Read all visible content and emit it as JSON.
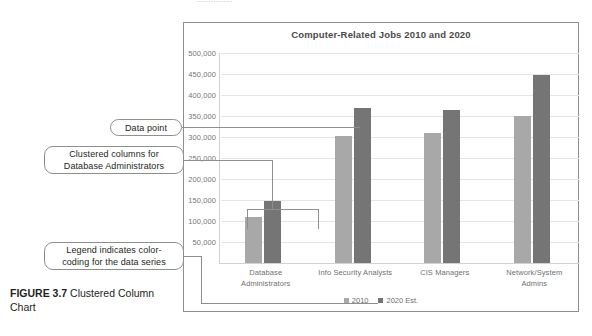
{
  "page": {
    "top_bleed_text": "..............."
  },
  "figure": {
    "number_label": "FIGURE 3.7",
    "caption_text": " Clustered Column Chart"
  },
  "chart": {
    "title": "Computer-Related Jobs 2010 and 2020",
    "legend_position": "bottom",
    "colors": {
      "series_2010": "#a8a8a8",
      "series_2020": "#757575",
      "gridline": "#e4e4e4",
      "axis": "#d2d2d2",
      "frame_border": "#8d8d8d",
      "title_text": "#4a4a4a",
      "tick_text": "#767676"
    }
  },
  "chart_data": {
    "type": "bar",
    "title": "Computer-Related Jobs 2010 and 2020",
    "xlabel": "",
    "ylabel": "",
    "ylim": [
      0,
      500000
    ],
    "ytick_step": 50000,
    "yticks": [
      50000,
      100000,
      150000,
      200000,
      250000,
      300000,
      350000,
      400000,
      450000,
      500000
    ],
    "ytick_labels": [
      "50,000",
      "100,000",
      "150,000",
      "200,000",
      "250,000",
      "300,000",
      "350,000",
      "400,000",
      "450,000",
      "500,000"
    ],
    "grid": true,
    "categories": [
      "Database Administrators",
      "Info Security Analysts",
      "CIS Managers",
      "Network/System Admins"
    ],
    "category_lines": [
      [
        "Database",
        "Administrators"
      ],
      [
        "Info Security Analysts"
      ],
      [
        "CIS Managers"
      ],
      [
        "Network/System",
        "Admins"
      ]
    ],
    "series": [
      {
        "name": "2010",
        "color": "#a8a8a8",
        "values": [
          110000,
          302000,
          310000,
          350000
        ]
      },
      {
        "name": "2020 Est.",
        "color": "#757575",
        "values": [
          148000,
          370000,
          365000,
          448000
        ]
      }
    ],
    "legend": [
      "2010",
      "2020 Est."
    ]
  },
  "annotations": [
    {
      "id": "data-point",
      "lines": [
        "Data point"
      ]
    },
    {
      "id": "clustered-columns",
      "lines": [
        "Clustered columns for",
        "Database Administrators"
      ]
    },
    {
      "id": "legend-note",
      "lines": [
        "Legend indicates color-",
        "coding for the data series"
      ]
    }
  ]
}
